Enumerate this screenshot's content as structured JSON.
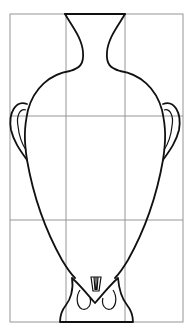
{
  "figure": {
    "grid": {
      "columns": 3,
      "rows": 3,
      "line_color": "#8a8a8a"
    },
    "outline_color": "#111111",
    "background": "#ffffff"
  }
}
